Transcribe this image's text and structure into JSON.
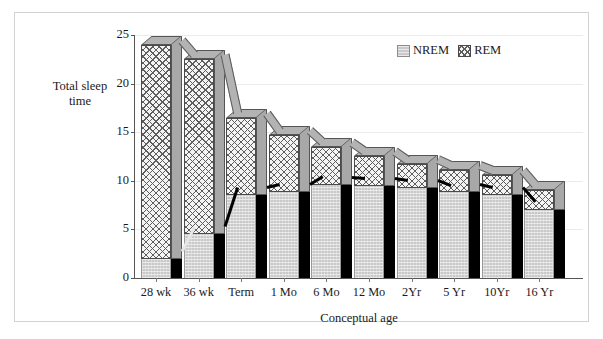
{
  "figure": {
    "y_axis_caption": "Total sleep\ntime",
    "y_caption_line1": "Total sleep",
    "y_caption_line2": "time",
    "x_axis_title": "Conceptual age"
  },
  "legend": {
    "position": "top-right",
    "items": [
      {
        "label": "NREM",
        "swatch": "solid-gray"
      },
      {
        "label": "REM",
        "swatch": "cross-hatch"
      }
    ]
  },
  "chart_data": {
    "type": "bar",
    "title": "",
    "subtitle": "",
    "xlabel": "Conceptual age",
    "ylabel": "Total sleep time",
    "stacked": true,
    "three_d": true,
    "grid": true,
    "legend_position": "top-right",
    "ylim": [
      0,
      25
    ],
    "yticks": [
      0,
      5,
      10,
      15,
      20,
      25
    ],
    "ytick_labels": [
      "0",
      "5",
      "10",
      "15",
      "20",
      "25"
    ],
    "categories": [
      "28 wk",
      "36 wk",
      "Term",
      "1 Mo",
      "6 Mo",
      "12 Mo",
      "2Yr",
      "5 Yr",
      "10Yr",
      "16 Yr"
    ],
    "series": [
      {
        "name": "NREM",
        "values": [
          2.0,
          4.5,
          8.5,
          8.8,
          9.6,
          9.5,
          9.3,
          8.8,
          8.5,
          7.0
        ]
      },
      {
        "name": "REM",
        "values": [
          22.0,
          18.0,
          8.0,
          5.9,
          3.9,
          3.1,
          2.4,
          2.3,
          2.1,
          2.1
        ]
      }
    ],
    "totals": [
      24.0,
      22.5,
      16.5,
      14.7,
      13.5,
      12.6,
      11.7,
      11.1,
      10.6,
      9.1
    ]
  }
}
